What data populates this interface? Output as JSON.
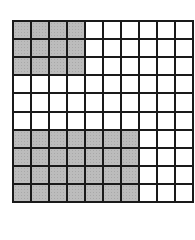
{
  "figure": {
    "type": "hundred-grid",
    "rows": 10,
    "cols": 10,
    "total_cells": 100,
    "shaded_color": "#bcbcbc",
    "unshaded_color": "#ffffff",
    "line_color": "#1a1a1a",
    "shaded_regions": [
      {
        "name": "top-left-block",
        "row_start": 0,
        "row_end": 2,
        "col_start": 0,
        "col_end": 3,
        "count": 12
      },
      {
        "name": "bottom-left-block",
        "row_start": 6,
        "row_end": 9,
        "col_start": 0,
        "col_end": 6,
        "count": 28
      }
    ],
    "shaded_total": 40
  }
}
